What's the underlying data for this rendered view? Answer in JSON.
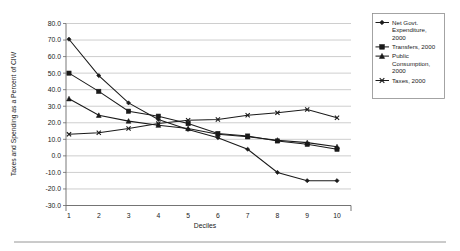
{
  "chart_data": {
    "type": "line",
    "title": "",
    "xlabel": "Deciles",
    "ylabel": "Taxes and Spending as a Percent of CIW",
    "categories": [
      "1",
      "2",
      "3",
      "4",
      "5",
      "6",
      "7",
      "8",
      "9",
      "10"
    ],
    "x": [
      1,
      2,
      3,
      4,
      5,
      6,
      7,
      8,
      9,
      10
    ],
    "ylim": [
      -30.0,
      80.0
    ],
    "ytick_step": 10.0,
    "ytick_labels": [
      "80.0",
      "70.0",
      "60.0",
      "50.0",
      "40.0",
      "30.0",
      "20.0",
      "10.0",
      "0.0",
      "-10.0",
      "-20.0",
      "-30.0"
    ],
    "ytick_values": [
      80.0,
      70.0,
      60.0,
      50.0,
      40.0,
      30.0,
      20.0,
      10.0,
      0.0,
      -10.0,
      -20.0,
      -30.0
    ],
    "xtick_labels": [
      "1",
      "2",
      "3",
      "4",
      "5",
      "6",
      "7",
      "8",
      "9",
      "10"
    ],
    "grid": "horizontal",
    "legend_position": "right",
    "series": [
      {
        "name": "Net Govt. Expenditure, 2000",
        "marker": "diamond",
        "color": "#1a1a1a",
        "values": [
          70.5,
          48.5,
          32.0,
          22.0,
          16.0,
          11.0,
          4.0,
          -10.0,
          -15.0,
          -15.0
        ]
      },
      {
        "name": "Transfers, 2000",
        "marker": "square",
        "color": "#1a1a1a",
        "values": [
          50.0,
          39.0,
          27.0,
          24.0,
          19.5,
          13.5,
          12.0,
          9.0,
          7.0,
          4.0
        ]
      },
      {
        "name": "Public Consumption, 2000",
        "marker": "triangle",
        "color": "#1a1a1a",
        "values": [
          34.5,
          24.5,
          21.0,
          18.5,
          16.5,
          13.0,
          11.5,
          9.5,
          8.0,
          5.5
        ]
      },
      {
        "name": "Taxes, 2000",
        "marker": "x",
        "color": "#1a1a1a",
        "values": [
          13.0,
          14.0,
          16.5,
          19.5,
          21.5,
          22.0,
          24.5,
          26.0,
          28.0,
          23.0
        ]
      }
    ]
  },
  "legend": {
    "entries": [
      {
        "label_lines": [
          "Net Govt.",
          "Expenditure,",
          "2000"
        ],
        "marker": "diamond"
      },
      {
        "label_lines": [
          "Transfers, 2000"
        ],
        "marker": "square"
      },
      {
        "label_lines": [
          "Public",
          "Consumption,",
          "2000"
        ],
        "marker": "triangle"
      },
      {
        "label_lines": [
          "Taxes, 2000"
        ],
        "marker": "x"
      }
    ]
  },
  "axis": {
    "y_title": "Taxes and Spending as a Percent of CIW",
    "x_title": "Deciles"
  }
}
